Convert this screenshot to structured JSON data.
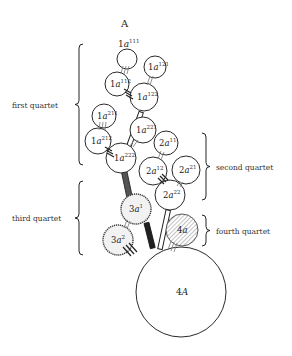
{
  "diagram": {
    "title": "A",
    "cells": [
      {
        "id": "1a111",
        "prefix": "1",
        "base": "a",
        "sup": "111",
        "cx": 127,
        "cy": 59,
        "r": 10,
        "style": "plain"
      },
      {
        "id": "1a121",
        "prefix": "1",
        "base": "a",
        "sup": "121",
        "cx": 155,
        "cy": 67,
        "r": 11,
        "style": "plain"
      },
      {
        "id": "1a112",
        "prefix": "1",
        "base": "a",
        "sup": "112",
        "cx": 117,
        "cy": 84,
        "r": 12,
        "style": "plain"
      },
      {
        "id": "1a122",
        "prefix": "1",
        "base": "a",
        "sup": "122",
        "cx": 144,
        "cy": 97,
        "r": 14,
        "style": "plain"
      },
      {
        "id": "1a211",
        "prefix": "1",
        "base": "a",
        "sup": "211",
        "cx": 104,
        "cy": 116,
        "r": 12,
        "style": "plain"
      },
      {
        "id": "1a221",
        "prefix": "1",
        "base": "a",
        "sup": "221",
        "cx": 143,
        "cy": 130,
        "r": 13,
        "style": "plain"
      },
      {
        "id": "1a212",
        "prefix": "1",
        "base": "a",
        "sup": "212",
        "cx": 98,
        "cy": 141,
        "r": 13,
        "style": "plain"
      },
      {
        "id": "1a222",
        "prefix": "1",
        "base": "a",
        "sup": "222",
        "cx": 121,
        "cy": 158,
        "r": 15,
        "style": "plain"
      },
      {
        "id": "2a11",
        "prefix": "2",
        "base": "a",
        "sup": "11",
        "cx": 166,
        "cy": 143,
        "r": 12,
        "style": "plain"
      },
      {
        "id": "2a12",
        "prefix": "2",
        "base": "a",
        "sup": "12",
        "cx": 153,
        "cy": 171,
        "r": 14,
        "style": "plain"
      },
      {
        "id": "2a21",
        "prefix": "2",
        "base": "a",
        "sup": "21",
        "cx": 186,
        "cy": 170,
        "r": 14,
        "style": "plain"
      },
      {
        "id": "2a22",
        "prefix": "2",
        "base": "a",
        "sup": "22",
        "cx": 170,
        "cy": 195,
        "r": 15,
        "style": "plain"
      },
      {
        "id": "3a1",
        "prefix": "3",
        "base": "a",
        "sup": "1",
        "cx": 136,
        "cy": 209,
        "r": 15,
        "style": "dotted"
      },
      {
        "id": "3a2",
        "prefix": "3",
        "base": "a",
        "sup": "2",
        "cx": 118,
        "cy": 240,
        "r": 15,
        "style": "dotted"
      },
      {
        "id": "4a",
        "prefix": "4",
        "base": "a",
        "sup": "",
        "cx": 182,
        "cy": 230,
        "r": 16,
        "style": "hatched"
      },
      {
        "id": "4A",
        "prefix": "4",
        "base": "A",
        "sup": "",
        "cx": 181,
        "cy": 292,
        "r": 45,
        "style": "big"
      }
    ],
    "quartets": [
      {
        "label": "first quartet",
        "side": "left",
        "y1": 44,
        "y2": 165,
        "bx": 79,
        "tx": 12
      },
      {
        "label": "second quartet",
        "side": "right",
        "y1": 133,
        "y2": 200,
        "bx": 206,
        "tx": 216
      },
      {
        "label": "third quartet",
        "side": "left",
        "y1": 181,
        "y2": 255,
        "bx": 79,
        "tx": 12
      },
      {
        "label": "fourth quartet",
        "side": "right",
        "y1": 215,
        "y2": 246,
        "bx": 206,
        "tx": 216
      }
    ],
    "colors": {
      "ink": "#222222",
      "background": "#ffffff",
      "hatch": "#888888",
      "stipple": "#f2f2f2"
    }
  }
}
